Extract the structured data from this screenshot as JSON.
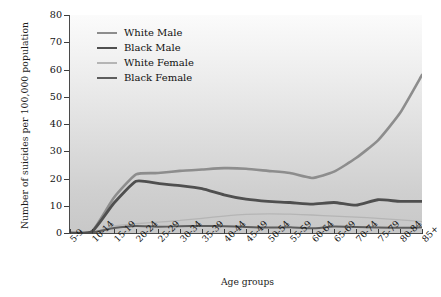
{
  "chart_data": {
    "type": "line",
    "title": "",
    "xlabel": "Age groups",
    "ylabel": "Number of suicides per 100,000 population",
    "ylim": [
      0,
      80
    ],
    "yticks": [
      0,
      10,
      20,
      30,
      40,
      50,
      60,
      70,
      80
    ],
    "grid": false,
    "legend_position": "upper left inside",
    "categories": [
      "5-9",
      "10-14",
      "15-19",
      "20-24",
      "25-29",
      "30-34",
      "35-39",
      "40-44",
      "45-49",
      "50-54",
      "55-59",
      "60-64",
      "65-69",
      "70-74",
      "75-79",
      "80-84",
      "85+"
    ],
    "series": [
      {
        "name": "White Male",
        "color": "#8d8d8d",
        "width": 2.6,
        "values": [
          0,
          0.6,
          13.0,
          21.5,
          22.0,
          22.8,
          23.3,
          23.8,
          23.6,
          22.8,
          22.0,
          20.2,
          22.5,
          27.5,
          34.0,
          44.0,
          58.0
        ]
      },
      {
        "name": "Black Male",
        "color": "#4f4f4f",
        "width": 2.8,
        "values": [
          0,
          0.5,
          11.0,
          19.0,
          18.2,
          17.4,
          16.3,
          14.0,
          12.4,
          11.6,
          11.2,
          10.6,
          11.2,
          10.2,
          12.2,
          11.6,
          11.6
        ]
      },
      {
        "name": "White Female",
        "color": "#b5b5b5",
        "width": 1.3,
        "values": [
          0,
          0.2,
          2.6,
          3.4,
          4.0,
          4.6,
          5.4,
          6.2,
          6.8,
          7.0,
          6.9,
          6.6,
          6.2,
          5.8,
          5.4,
          4.8,
          4.2
        ]
      },
      {
        "name": "Black Female",
        "color": "#5d5d5d",
        "width": 2.0,
        "values": [
          0,
          0.2,
          1.8,
          2.6,
          2.3,
          2.5,
          2.6,
          2.5,
          2.2,
          2.0,
          2.1,
          1.7,
          2.4,
          2.2,
          2.0,
          1.9,
          2.1
        ]
      }
    ]
  },
  "legend": {
    "items": [
      {
        "label": "White Male"
      },
      {
        "label": "Black Male"
      },
      {
        "label": "White Female"
      },
      {
        "label": "Black Female"
      }
    ]
  }
}
